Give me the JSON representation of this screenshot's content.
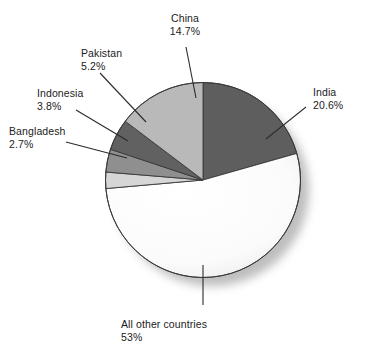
{
  "chart_data": {
    "type": "pie",
    "title": "",
    "subtitle": "",
    "xlabel": "",
    "ylabel": "",
    "legend_position": "callout-labels",
    "grid": false,
    "start_angle_deg": 0,
    "direction": "clockwise",
    "categories": [
      "India",
      "All other countries",
      "Bangladesh",
      "Indonesia",
      "Pakistan",
      "China"
    ],
    "values": [
      20.6,
      53,
      2.7,
      3.8,
      5.2,
      14.7
    ],
    "slices": [
      {
        "name": "India",
        "label": "India",
        "percent_text": "20.6%",
        "value": 20.6,
        "color": "#5e5e5e"
      },
      {
        "name": "All other countries",
        "label": "All other countries",
        "percent_text": "53%",
        "value": 53,
        "color": "#fdfdfd"
      },
      {
        "name": "Bangladesh",
        "label": "Bangladesh",
        "percent_text": "2.7%",
        "value": 2.7,
        "color": "#d6d6d6"
      },
      {
        "name": "Indonesia",
        "label": "Indonesia",
        "percent_text": "3.8%",
        "value": 3.8,
        "color": "#8f8f8f"
      },
      {
        "name": "Pakistan",
        "label": "Pakistan",
        "percent_text": "5.2%",
        "value": 5.2,
        "color": "#616161"
      },
      {
        "name": "China",
        "label": "China",
        "percent_text": "14.7%",
        "value": 14.7,
        "color": "#b9b9b9"
      }
    ]
  },
  "colors": {
    "background": "#ffffff",
    "text": "#1b1b1b",
    "outline": "#3a3a3a",
    "leader_line": "#2b2b2b",
    "shadow": "#b5b5b5"
  },
  "labels": {
    "china": {
      "name": "China",
      "percent": "14.7%"
    },
    "india": {
      "name": "India",
      "percent": "20.6%"
    },
    "pakistan": {
      "name": "Pakistan",
      "percent": "5.2%"
    },
    "indonesia": {
      "name": "Indonesia",
      "percent": "3.8%"
    },
    "bangladesh": {
      "name": "Bangladesh",
      "percent": "2.7%"
    },
    "all_other": {
      "name": "All other countries",
      "percent": "53%"
    }
  }
}
